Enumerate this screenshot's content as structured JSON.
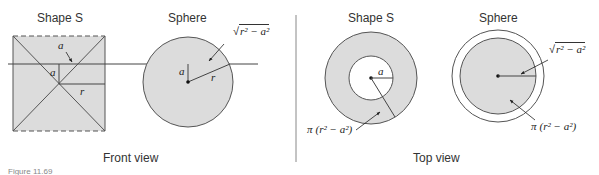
{
  "figure": {
    "caption": "Figure 11.69",
    "colors": {
      "fill": "#dcdcdc",
      "stroke": "#444444",
      "divider": "#888888",
      "background": "#ffffff"
    },
    "front_view": {
      "label": "Front view",
      "shape_s": {
        "title": "Shape S",
        "label_a_top": "a",
        "label_a_side": "a",
        "label_r": "r"
      },
      "sphere": {
        "title": "Sphere",
        "label_a": "a",
        "label_r": "r",
        "label_sqrt_prefix": "√",
        "label_sqrt_body": "r² − a²"
      }
    },
    "top_view": {
      "label": "Top view",
      "shape_s": {
        "title": "Shape S",
        "label_a": "a",
        "area_pi": "π",
        "area_body": "(r² − a²)"
      },
      "sphere": {
        "title": "Sphere",
        "label_sqrt_prefix": "√",
        "label_sqrt_body": "r² − a²",
        "area_pi": "π",
        "area_body": "(r² − a²)"
      }
    }
  }
}
